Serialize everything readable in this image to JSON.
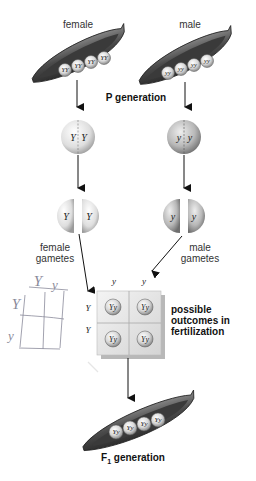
{
  "labels": {
    "female": "female",
    "male": "male",
    "p_generation": "P generation",
    "female_gametes_1": "female",
    "female_gametes_2": "gametes",
    "male_gametes_1": "male",
    "male_gametes_2": "gametes",
    "outcomes_1": "possible",
    "outcomes_2": "outcomes in",
    "outcomes_3": "fertilization",
    "f1_prefix": "F",
    "f1_sub": "1",
    "f1_suffix": " generation"
  },
  "p_pods": {
    "female": {
      "peas": [
        "YY",
        "YY",
        "YY",
        "YY"
      ]
    },
    "male": {
      "peas": [
        "yy",
        "yy",
        "yy",
        "yy"
      ]
    }
  },
  "parent_cells": {
    "female": {
      "alleles": [
        "Y",
        "Y"
      ]
    },
    "male": {
      "alleles": [
        "y",
        "y"
      ]
    }
  },
  "gametes": {
    "female": {
      "alleles": [
        "Y",
        "Y"
      ]
    },
    "male": {
      "alleles": [
        "y",
        "y"
      ]
    }
  },
  "punnett": {
    "col_headers": [
      "y",
      "y"
    ],
    "row_headers": [
      "Y",
      "Y"
    ],
    "cells": [
      [
        "Yy",
        "Yy"
      ],
      [
        "Yy",
        "Yy"
      ]
    ]
  },
  "sketch": {
    "col_headers": [
      "Y",
      "y"
    ],
    "row_headers": [
      "Y",
      "y"
    ]
  },
  "f1_pod": {
    "peas": [
      "Yy",
      "Yy",
      "Yy",
      "Yy"
    ]
  }
}
